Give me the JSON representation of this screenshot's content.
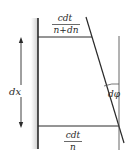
{
  "diagram": {
    "dimension_label": "dx",
    "angle_label": "dφ",
    "top_fraction": {
      "numerator": "cdt",
      "denominator": "n+dn"
    },
    "bottom_fraction": {
      "numerator": "cdt",
      "denominator": "n"
    },
    "colors": {
      "line": "#2a2a2a",
      "shade": "#d8d8d8"
    }
  }
}
